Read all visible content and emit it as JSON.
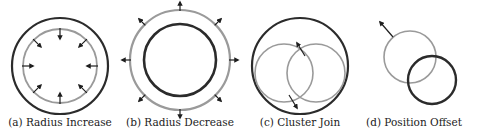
{
  "colors": {
    "dark": "#2b2b2b",
    "gray": "#9a9a9a",
    "arrow": "#1e1e1e"
  },
  "panels": [
    {
      "id": "a",
      "caption": "(a) Radius Increase",
      "caption_x": 60,
      "circles": [
        {
          "cx": 60,
          "cy": 66,
          "r": 48,
          "tone": "dark",
          "width": 2.2
        },
        {
          "cx": 60,
          "cy": 66,
          "r": 37,
          "tone": "gray",
          "width": 1.8
        }
      ],
      "arrows": {
        "type": "radial-in",
        "cx": 60,
        "cy": 66,
        "r_start": 37,
        "len": 10,
        "count": 8
      }
    },
    {
      "id": "b",
      "caption": "(b) Radius Decrease",
      "caption_x": 180,
      "circles": [
        {
          "cx": 180,
          "cy": 60,
          "r": 50,
          "tone": "gray",
          "width": 2.2
        },
        {
          "cx": 180,
          "cy": 60,
          "r": 36,
          "tone": "dark",
          "width": 2.6
        }
      ],
      "arrows": {
        "type": "radial-out",
        "cx": 180,
        "cy": 60,
        "r_start": 50,
        "len": 8,
        "count": 8
      }
    },
    {
      "id": "c",
      "caption": "(c) Cluster Join",
      "caption_x": 300,
      "circles": [
        {
          "cx": 300,
          "cy": 66,
          "r": 48,
          "tone": "dark",
          "width": 2.2
        },
        {
          "cx": 284,
          "cy": 73,
          "r": 29,
          "tone": "gray",
          "width": 1.6
        },
        {
          "cx": 316,
          "cy": 73,
          "r": 29,
          "tone": "gray",
          "width": 1.6
        }
      ],
      "arrows": {
        "type": "list",
        "items": [
          {
            "x1": 305,
            "y1": 56,
            "x2": 297,
            "y2": 43
          },
          {
            "x1": 289,
            "y1": 95,
            "x2": 297,
            "y2": 108
          }
        ]
      }
    },
    {
      "id": "d",
      "caption": "(d) Position Offset",
      "caption_x": 414,
      "circles": [
        {
          "cx": 410,
          "cy": 57,
          "r": 26,
          "tone": "gray",
          "width": 1.6
        },
        {
          "cx": 432,
          "cy": 80,
          "r": 24,
          "tone": "dark",
          "width": 2.4
        }
      ],
      "arrows": {
        "type": "list",
        "items": [
          {
            "x1": 393,
            "y1": 37,
            "x2": 380,
            "y2": 22
          }
        ]
      }
    }
  ]
}
